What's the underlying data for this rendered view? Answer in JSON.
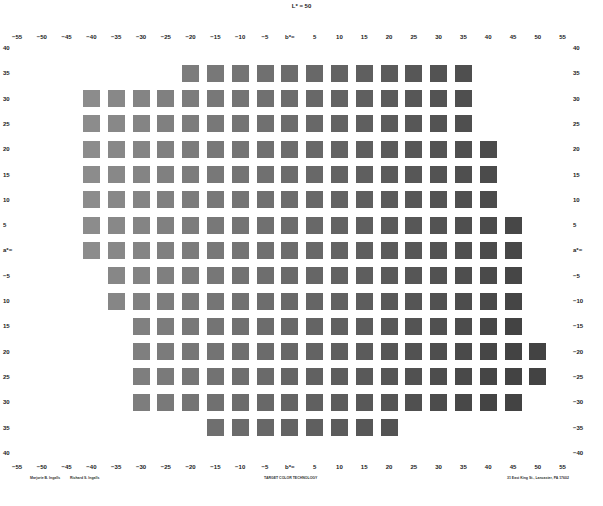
{
  "chart_data": {
    "type": "heatmap",
    "title": "L* = 50",
    "xlabel": "a*",
    "ylabel": "b*",
    "x_ticks": [
      "−55",
      "−50",
      "−45",
      "−40",
      "−35",
      "−30",
      "−25",
      "−20",
      "−15",
      "−10",
      "−5",
      "b*=",
      "5",
      "10",
      "15",
      "20",
      "25",
      "30",
      "35",
      "40",
      "45",
      "50",
      "55"
    ],
    "x_values": [
      -55,
      -50,
      -45,
      -40,
      -35,
      -30,
      -25,
      -20,
      -15,
      -10,
      -5,
      0,
      5,
      10,
      15,
      20,
      25,
      30,
      35,
      40,
      45,
      50,
      55
    ],
    "y_ticks": [
      "40",
      "35",
      "30",
      "25",
      "20",
      "15",
      "10",
      "5",
      "a*=",
      "−5",
      "10",
      "15",
      "20",
      "25",
      "30",
      "35",
      "40"
    ],
    "y_ticks_right": [
      "40",
      "35",
      "30",
      "25",
      "20",
      "15",
      "10",
      "5",
      "a*=",
      "−5",
      "−10",
      "−15",
      "−20",
      "−25",
      "−30",
      "−35",
      "−40"
    ],
    "y_values": [
      40,
      35,
      30,
      25,
      20,
      15,
      10,
      5,
      0,
      -5,
      -10,
      -15,
      -20,
      -25,
      -30,
      -35,
      -40
    ],
    "rows": [
      {
        "y": 35,
        "x_from": -20,
        "x_to": 35
      },
      {
        "y": 30,
        "x_from": -40,
        "x_to": 35
      },
      {
        "y": 25,
        "x_from": -40,
        "x_to": 35
      },
      {
        "y": 20,
        "x_from": -40,
        "x_to": 40
      },
      {
        "y": 15,
        "x_from": -40,
        "x_to": 40
      },
      {
        "y": 10,
        "x_from": -40,
        "x_to": 40
      },
      {
        "y": 5,
        "x_from": -40,
        "x_to": 45
      },
      {
        "y": 0,
        "x_from": -40,
        "x_to": 45
      },
      {
        "y": -5,
        "x_from": -35,
        "x_to": 45
      },
      {
        "y": -10,
        "x_from": -35,
        "x_to": 45
      },
      {
        "y": -15,
        "x_from": -30,
        "x_to": 45
      },
      {
        "y": -20,
        "x_from": -30,
        "x_to": 50
      },
      {
        "y": -25,
        "x_from": -30,
        "x_to": 50
      },
      {
        "y": -30,
        "x_from": -30,
        "x_to": 45
      },
      {
        "y": -35,
        "x_from": -15,
        "x_to": 20
      }
    ],
    "color_range": {
      "light": "#8c8c8c",
      "dark": "#434343"
    },
    "grid": false
  },
  "credits": {
    "author1": "Marjorie B. Ingalls",
    "author2": "Richard S. Ingalls",
    "company": "TARGET COLOR TECHNOLOGY",
    "address": "31 East King St., Lancaster, PA 17602"
  }
}
